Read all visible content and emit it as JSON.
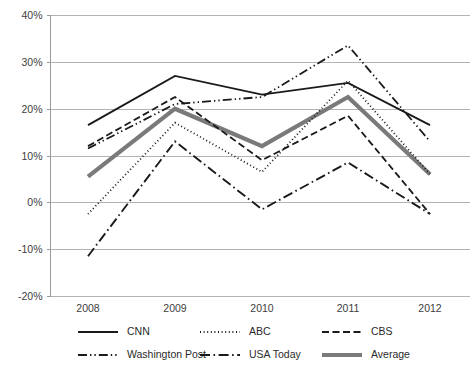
{
  "chart_data": {
    "type": "line",
    "title": "",
    "subtitle": "",
    "xlabel": "",
    "ylabel": "",
    "categories": [
      "2008",
      "2009",
      "2010",
      "2011",
      "2012"
    ],
    "x": [
      2008,
      2009,
      2010,
      2011,
      2012
    ],
    "ylim": [
      -20,
      40
    ],
    "ytick_labels": [
      "40%",
      "30%",
      "20%",
      "10%",
      "0%",
      "-10%",
      "-20%"
    ],
    "ytick_values": [
      40,
      30,
      20,
      10,
      0,
      -10,
      -20
    ],
    "grid": "horizontal",
    "legend_position": "bottom",
    "series": [
      {
        "name": "CNN",
        "values": [
          16.5,
          27.0,
          23.0,
          25.5,
          16.5
        ],
        "style": "solid",
        "color": "#1a1a1a",
        "width": 1.9,
        "dash": "none",
        "legend_key": "cnn"
      },
      {
        "name": "ABC",
        "values": [
          -2.5,
          17.0,
          6.5,
          26.0,
          6.0
        ],
        "style": "dotted",
        "color": "#1a1a1a",
        "width": 1.8,
        "dash": "1,2.6",
        "legend_key": "abc"
      },
      {
        "name": "CBS",
        "values": [
          12.0,
          22.5,
          9.0,
          18.5,
          -2.5
        ],
        "style": "dashed",
        "color": "#1a1a1a",
        "width": 1.8,
        "dash": "7,3.5",
        "legend_key": "cbs"
      },
      {
        "name": "Washington Post",
        "values": [
          11.5,
          21.0,
          22.5,
          33.5,
          13.0
        ],
        "style": "dash-dot-dot",
        "color": "#1a1a1a",
        "width": 1.8,
        "dash": "9,3,1.4,3,1.4,3",
        "legend_key": "washington-post"
      },
      {
        "name": "USA Today",
        "values": [
          -11.5,
          13.0,
          -1.5,
          8.5,
          -2.5
        ],
        "style": "dash-dot",
        "color": "#1a1a1a",
        "width": 1.9,
        "dash": "10,3.5,1.6,3.5",
        "legend_key": "usa-today"
      },
      {
        "name": "Average",
        "values": [
          5.5,
          20.0,
          12.0,
          22.5,
          6.0
        ],
        "style": "solid-thick",
        "color": "#7a7a7a",
        "width": 4.2,
        "dash": "none",
        "legend_key": "average"
      }
    ]
  },
  "legend": {
    "rows": [
      [
        "CNN",
        "ABC",
        "CBS"
      ],
      [
        "Washington Post",
        "USA Today",
        "Average"
      ]
    ]
  },
  "colors": {
    "grid": "#b3b3b3",
    "axis": "#9a9a9a",
    "text": "#404040",
    "series_dark": "#1a1a1a",
    "series_average": "#7a7a7a",
    "background": "#ffffff"
  }
}
